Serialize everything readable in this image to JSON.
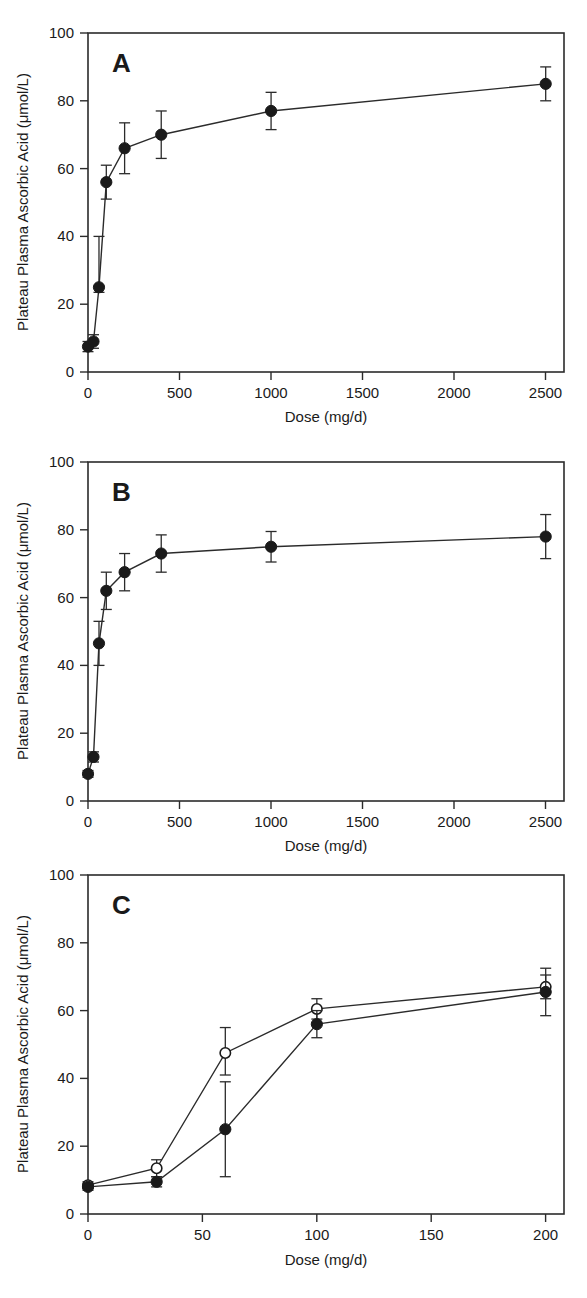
{
  "figure": {
    "axis_title_x": "Dose (mg/d)",
    "axis_title_y": "Plateau Plasma Ascorbic Acid (μmol/L)",
    "ink_color": "#1a1a1a",
    "background_color": "#ffffff"
  },
  "panels": [
    {
      "letter": "A"
    },
    {
      "letter": "B"
    },
    {
      "letter": "C"
    }
  ],
  "chart_data": [
    {
      "type": "line",
      "title": "A",
      "xlabel": "Dose (mg/d)",
      "ylabel": "Plateau Plasma Ascorbic Acid (μmol/L)",
      "xlim": [
        0,
        2600
      ],
      "ylim": [
        0,
        100
      ],
      "xticks": [
        0,
        500,
        1000,
        1500,
        2000,
        2500
      ],
      "xtick_labels": [
        "0",
        "500",
        "1000",
        "1500",
        "2000",
        "2500"
      ],
      "yticks": [
        0,
        20,
        40,
        60,
        80,
        100
      ],
      "ytick_labels": [
        "0",
        "20",
        "40",
        "60",
        "80",
        "100"
      ],
      "grid": false,
      "legend": "none",
      "series": [
        {
          "name": "plateau plasma ascorbic acid",
          "marker": "filled-circle",
          "x": [
            0,
            30,
            60,
            100,
            200,
            400,
            1000,
            2500
          ],
          "y": [
            7.5,
            9,
            25,
            56,
            66,
            70,
            77,
            85
          ],
          "yerr_low": [
            1.5,
            2,
            1.5,
            5,
            7.5,
            7,
            5.5,
            5
          ],
          "yerr_high": [
            1.5,
            2,
            15,
            5,
            7.5,
            7,
            5.5,
            5
          ]
        }
      ]
    },
    {
      "type": "line",
      "title": "B",
      "xlabel": "Dose (mg/d)",
      "ylabel": "Plateau Plasma Ascorbic Acid (μmol/L)",
      "xlim": [
        0,
        2600
      ],
      "ylim": [
        0,
        100
      ],
      "xticks": [
        0,
        500,
        1000,
        1500,
        2000,
        2500
      ],
      "xtick_labels": [
        "0",
        "500",
        "1000",
        "1500",
        "2000",
        "2500"
      ],
      "yticks": [
        0,
        20,
        40,
        60,
        80,
        100
      ],
      "ytick_labels": [
        "0",
        "20",
        "40",
        "60",
        "80",
        "100"
      ],
      "grid": false,
      "legend": "none",
      "series": [
        {
          "name": "plateau plasma ascorbic acid",
          "marker": "filled-circle",
          "x": [
            0,
            30,
            60,
            100,
            200,
            400,
            1000,
            2500
          ],
          "y": [
            8,
            13,
            46.5,
            62,
            67.5,
            73,
            75,
            78
          ],
          "yerr_low": [
            1,
            1.5,
            6.5,
            5.5,
            5.5,
            5.5,
            4.5,
            6.5
          ],
          "yerr_high": [
            1,
            1.5,
            6.5,
            5.5,
            5.5,
            5.5,
            4.5,
            6.5
          ]
        }
      ]
    },
    {
      "type": "line",
      "title": "C",
      "xlabel": "Dose (mg/d)",
      "ylabel": "Plateau Plasma Ascorbic Acid (μmol/L)",
      "xlim": [
        0,
        208
      ],
      "ylim": [
        0,
        100
      ],
      "xticks": [
        0,
        50,
        100,
        150,
        200
      ],
      "xtick_labels": [
        "0",
        "50",
        "100",
        "150",
        "200"
      ],
      "yticks": [
        0,
        20,
        40,
        60,
        80,
        100
      ],
      "ytick_labels": [
        "0",
        "20",
        "40",
        "60",
        "80",
        "100"
      ],
      "grid": false,
      "legend": "none",
      "series": [
        {
          "name": "open-circle series",
          "marker": "open-circle",
          "x": [
            0,
            30,
            60,
            100,
            200
          ],
          "y": [
            8.5,
            13.5,
            47.5,
            60.5,
            67
          ],
          "yerr_low": [
            1,
            2.5,
            6.5,
            3,
            3.5
          ],
          "yerr_high": [
            1,
            2.5,
            7.5,
            3,
            3.5
          ]
        },
        {
          "name": "filled-circle series",
          "marker": "filled-circle",
          "x": [
            0,
            30,
            60,
            100,
            200
          ],
          "y": [
            8,
            9.5,
            25,
            56,
            65.5
          ],
          "yerr_low": [
            1,
            1.5,
            14,
            4,
            7
          ],
          "yerr_high": [
            1,
            1.5,
            14,
            4,
            7
          ]
        }
      ]
    }
  ]
}
